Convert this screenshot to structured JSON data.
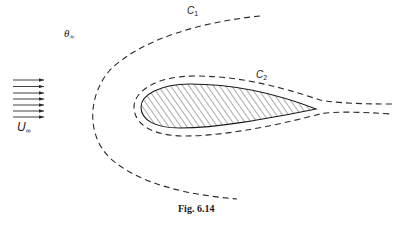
{
  "figure": {
    "caption": "Fig. 6.14",
    "labels": {
      "theta_inf": {
        "symbol": "θ",
        "subscript": "∞"
      },
      "u_inf": {
        "symbol": "U",
        "subscript": "∞"
      },
      "c1": {
        "symbol": "C",
        "subscript": "1"
      },
      "c2": {
        "symbol": "C",
        "subscript": "2"
      }
    },
    "elements": {
      "freestream_arrows_count": 7,
      "body": "hatched airfoil-shaped body",
      "contour_outer": "dashed contour C1 enclosing body, open on right",
      "contour_inner": "dashed contour C2 hugging body with wake lines to right"
    },
    "colors": {
      "ink": "#1a1a1a",
      "background": "#ffffff"
    }
  }
}
